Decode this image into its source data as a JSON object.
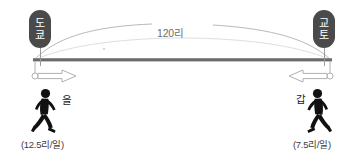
{
  "diagram": {
    "type": "distance-travel-diagram",
    "colors": {
      "pin_fill": "#4a4a4a",
      "pin_text": "#ffffff",
      "road": "#6b6b6b",
      "arc": "#b9b9b9",
      "arrow_outline": "#b0b0b0",
      "figure": "#111111",
      "label_text": "#1a1a1a",
      "caption_text": "#3d3d3d",
      "distance_text": "#6e6e6e",
      "background": "#ffffff"
    },
    "pins": [
      {
        "name": "tokyo",
        "chars": [
          "도",
          "쿄"
        ],
        "label": "도쿄",
        "position": "left"
      },
      {
        "name": "kyoto",
        "chars": [
          "교",
          "토"
        ],
        "label": "교토",
        "position": "right"
      }
    ],
    "distance": {
      "label": "120리",
      "value": 120,
      "unit": "리"
    },
    "travelers": [
      {
        "name": "eul",
        "label": "을",
        "direction": "right",
        "start": "도쿄",
        "speed_caption": "(12.5리/일)",
        "speed_value": 12.5,
        "speed_unit": "리/일"
      },
      {
        "name": "gap",
        "label": "갑",
        "direction": "left",
        "start": "교토",
        "speed_caption": "(7.5리/일)",
        "speed_value": 7.5,
        "speed_unit": "리/일"
      }
    ],
    "road": {
      "name": "road-bar",
      "description": "horizontal road between Tokyo and Kyoto"
    },
    "arrows": [
      {
        "name": "arrow-right",
        "direction": "right"
      },
      {
        "name": "arrow-left",
        "direction": "left"
      }
    ]
  }
}
